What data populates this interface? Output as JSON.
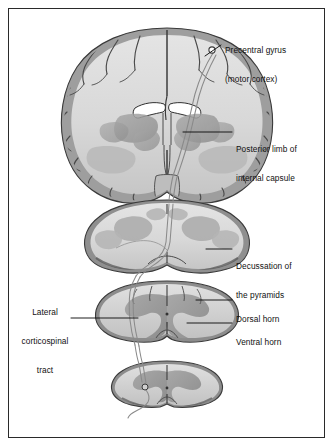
{
  "figure": {
    "frame_color": "#2a2a2a",
    "background": "#ffffff"
  },
  "palette": {
    "white_matter": "#dcdcdc",
    "gray_matter": "#9c9c9c",
    "cortex_band": "#b4b4b4",
    "outline": "#3a3a3a",
    "tract_line": "#7a7a7a",
    "leader_line": "#111111",
    "text": "#111111",
    "cell_body_fill": "#ffffff"
  },
  "labels": [
    {
      "id": "precentral-gyrus",
      "line1": "Precentral gyrus",
      "line2": "(motor cortex)",
      "side": "right"
    },
    {
      "id": "posterior-limb",
      "line1": "Posterior limb of",
      "line2": "internal capsule",
      "side": "right"
    },
    {
      "id": "decussation",
      "line1": "Decussation of",
      "line2": "the pyramids",
      "side": "right"
    },
    {
      "id": "dorsal-horn",
      "line1": "Dorsal horn",
      "line2": "",
      "side": "right"
    },
    {
      "id": "ventral-horn",
      "line1": "Ventral horn",
      "line2": "",
      "side": "right"
    },
    {
      "id": "lateral-corticospinal-tract",
      "line1": "Lateral",
      "line2": "corticospinal",
      "line3": "tract",
      "side": "left"
    }
  ],
  "sections": [
    {
      "id": "coronal-brain-section",
      "name": "Coronal section of cerebrum"
    },
    {
      "id": "medulla-section",
      "name": "Medulla oblongata cross-section"
    },
    {
      "id": "cervical-cord-section",
      "name": "Cervical spinal cord cross-section"
    },
    {
      "id": "lumbar-cord-section",
      "name": "Lumbar spinal cord cross-section"
    }
  ],
  "markers": [
    {
      "id": "upper-motor-neuron-soma",
      "name": "Upper motor neuron cell body"
    },
    {
      "id": "lower-motor-neuron-soma",
      "name": "Lower motor neuron cell body"
    }
  ]
}
